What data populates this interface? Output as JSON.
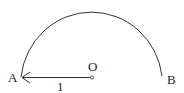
{
  "diagram": {
    "points": {
      "A": {
        "label": "A"
      },
      "O": {
        "label": "O"
      },
      "B": {
        "label": "B"
      }
    },
    "segment_label": "1",
    "stroke_color": "#333333"
  }
}
